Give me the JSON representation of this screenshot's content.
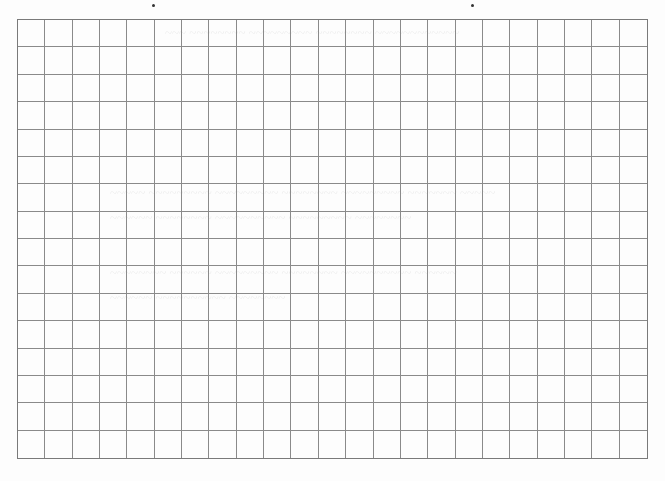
{
  "page": {
    "type": "graph-paper",
    "grid": {
      "columns": 23,
      "rows": 16,
      "line_color": "#8a8a8a",
      "border_color": "#7a7a7a",
      "background": "#fdfdfd"
    }
  },
  "ghost_text": [
    {
      "text": "~~~ ~~~~~~~~ ~~~~~~~~~ ~~~~~~~~ ~~~~~~~~~~~~",
      "x": 165,
      "y": 25
    },
    {
      "text": "~~~~~ ~~~~~~~~~ ~~~~~~~~~ ~~~~~~~~ ~~~~~~~~~ ~~~~~~~ ~~~~~",
      "x": 110,
      "y": 185
    },
    {
      "text": "~~~~~~ ~~~~~~~~ ~~~~~~~~~~ ~~~~~~~~~ ~~~~~~~~",
      "x": 110,
      "y": 210
    },
    {
      "text": "~~~~~~~~ ~~~~~~ ~~~~~~~~~ ~~~~~~~~ ~~~~~~~~~~ ~~~~~~",
      "x": 110,
      "y": 265
    },
    {
      "text": "~~~~~~ ~~~~~~~~~~ ~~~~~~~~",
      "x": 110,
      "y": 290
    }
  ]
}
